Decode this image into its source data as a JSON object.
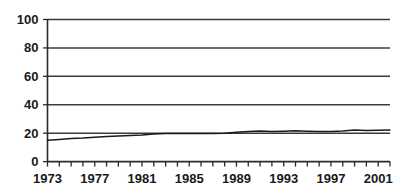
{
  "chart_data": {
    "type": "line",
    "title": "",
    "subtitle": "",
    "xlabel": "",
    "ylabel": "",
    "xlim": [
      1973,
      2002
    ],
    "ylim": [
      0,
      100
    ],
    "grid": true,
    "legend": "none",
    "y_ticks": [
      0,
      20,
      40,
      60,
      80,
      100
    ],
    "y_tick_labels": [
      "0",
      "20",
      "40",
      "60",
      "80",
      "100"
    ],
    "x_tick_labels": [
      "1973",
      "1977",
      "1981",
      "1985",
      "1989",
      "1993",
      "1997",
      "2001"
    ],
    "x_tick_label_years": [
      1973,
      1977,
      1981,
      1985,
      1989,
      1993,
      1997,
      2001
    ],
    "x_minor_tick_years": [
      1973,
      1974,
      1975,
      1976,
      1977,
      1978,
      1979,
      1980,
      1981,
      1982,
      1983,
      1984,
      1985,
      1986,
      1987,
      1988,
      1989,
      1990,
      1991,
      1992,
      1993,
      1994,
      1995,
      1996,
      1997,
      1998,
      1999,
      2000,
      2001,
      2002
    ],
    "series": [
      {
        "name": "series-1",
        "color": "#1a1a1a",
        "x": [
          1973,
          1974,
          1975,
          1976,
          1977,
          1978,
          1979,
          1980,
          1981,
          1982,
          1983,
          1984,
          1985,
          1986,
          1987,
          1988,
          1989,
          1990,
          1991,
          1992,
          1993,
          1994,
          1995,
          1996,
          1997,
          1998,
          1999,
          2000,
          2001,
          2002
        ],
        "values": [
          15.0,
          15.6,
          16.3,
          16.6,
          17.1,
          17.6,
          18.0,
          18.4,
          18.8,
          19.4,
          19.7,
          19.7,
          19.7,
          19.7,
          19.8,
          20.0,
          20.6,
          21.2,
          21.5,
          21.2,
          21.4,
          21.7,
          21.4,
          21.1,
          21.2,
          21.5,
          22.2,
          21.8,
          22.0,
          22.3
        ]
      }
    ]
  },
  "axes": {
    "y_axis_name": "y-axis",
    "x_axis_name": "x-axis"
  }
}
